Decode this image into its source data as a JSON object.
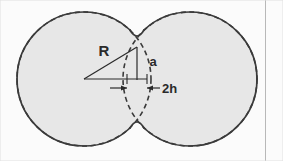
{
  "figure": {
    "background_color": "#fbfbfb",
    "canvas": {
      "width": 283,
      "height": 161
    },
    "sphere_fill_color": "#e7e7e7",
    "outline_color": "#3a3a3a",
    "annotation_color": "#2a2a2a",
    "border_color": "#b8b8b8"
  },
  "labels": {
    "radius": "R",
    "neck_half_width": "a",
    "overlap": "2h"
  },
  "geometry": {
    "left_sphere": {
      "cx": 84,
      "cy": 79,
      "r": 67,
      "style": "dashed"
    },
    "right_sphere": {
      "cx": 190,
      "cy": 79,
      "r": 67,
      "style": "dashed"
    },
    "neck_top": {
      "x": 137,
      "y": 47
    },
    "neck_bottom": {
      "x": 137,
      "y": 111
    },
    "center_point": {
      "x": 84,
      "y": 79
    },
    "baseline_end": {
      "x": 147,
      "y": 79
    },
    "dimension_line_y": 87,
    "dimension_left_x": 118,
    "dimension_right_x": 156,
    "right_border_x": 265
  }
}
